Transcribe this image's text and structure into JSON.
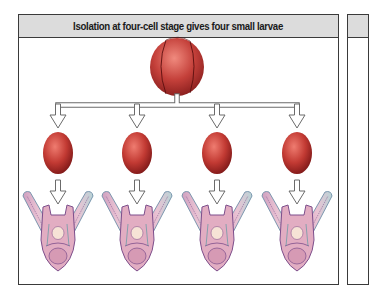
{
  "panel": {
    "title": "Isolation at four-cell stage gives four small larvae"
  },
  "figure": {
    "top_item": "four-cell-embryo",
    "middle_items": [
      "isolated-blastomere",
      "isolated-blastomere",
      "isolated-blastomere",
      "isolated-blastomere"
    ],
    "bottom_items": [
      "small-pluteus-larva",
      "small-pluteus-larva",
      "small-pluteus-larva",
      "small-pluteus-larva"
    ],
    "count": 4
  },
  "colors": {
    "header_bg": "#dcdcdc",
    "border": "#3a3a3a",
    "cell_dark": "#8e1c1c",
    "cell_light": "#e86a5e",
    "larva_fill": "#e7b7c8",
    "larva_stroke": "#7d4f8c",
    "arm_stroke": "#5f9aa3",
    "arrow_stroke": "#6b6b6b"
  }
}
